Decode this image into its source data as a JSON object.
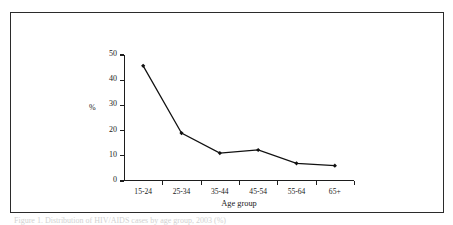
{
  "figure": {
    "frame_color": "#2b2b2b",
    "background": "#ffffff",
    "caption": "Figure 1. Distribution of HIV/AIDS cases by age group, 2003 (%)"
  },
  "chart_data": {
    "type": "line",
    "title": "",
    "subtitle": "",
    "xlabel": "Age group",
    "ylabel": "%",
    "categories": [
      "15-24",
      "25-34",
      "35-44",
      "45-54",
      "55-64",
      "65+"
    ],
    "values": [
      45.7,
      19.0,
      11.1,
      12.3,
      7.0,
      6.1
    ],
    "series": [
      {
        "name": "%",
        "values": [
          45.7,
          19.0,
          11.1,
          12.3,
          7.0,
          6.1
        ]
      }
    ],
    "ylim": [
      0,
      50
    ],
    "yticks": [
      0,
      10,
      20,
      30,
      40,
      50
    ],
    "ytick_labels": [
      "0",
      "10",
      "20",
      "30",
      "40",
      "50"
    ],
    "grid": false,
    "legend": false,
    "legend_position": "none",
    "line_color": "#111111",
    "marker": "diamond",
    "marker_color": "#111111"
  }
}
